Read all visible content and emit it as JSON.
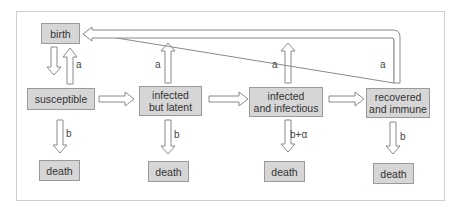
{
  "diagram": {
    "nodes": {
      "birth": "birth",
      "susceptible": "susceptible",
      "latent_line1": "infected",
      "latent_line2": "but latent",
      "infectious_line1": "infected",
      "infectious_line2": "and infectious",
      "recovered_line1": "recovered",
      "recovered_line2": "and immune",
      "death1": "death",
      "death2": "death",
      "death3": "death",
      "death4": "death"
    },
    "rates": {
      "birth_to_susc": "a",
      "latent_birth": "a",
      "infectious_birth": "a",
      "recovered_birth": "a",
      "susc_death": "b",
      "latent_death": "b",
      "infectious_death": "b+α",
      "recovered_death": "b"
    }
  }
}
